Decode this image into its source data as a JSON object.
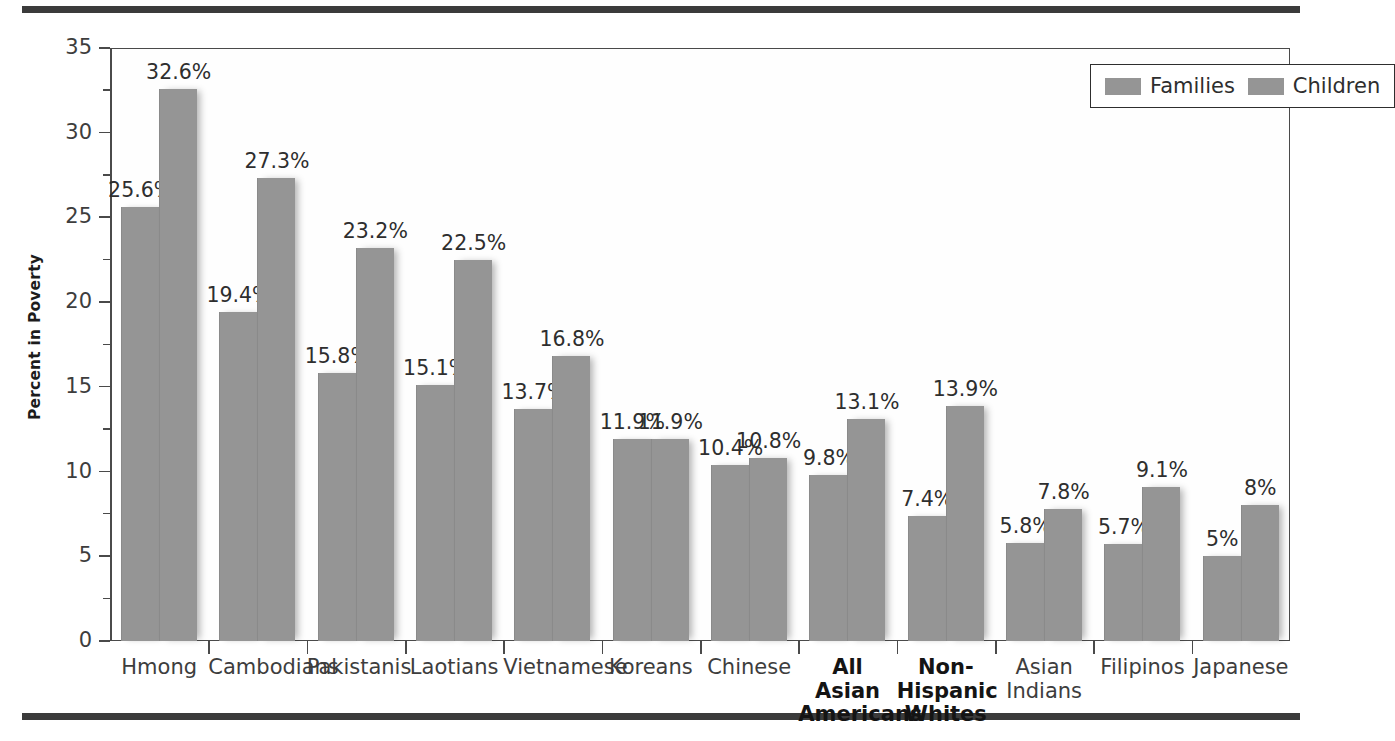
{
  "figure": {
    "y_axis_title": "Percent in Poverty",
    "rule_color": "#3b3b3b",
    "bar_color": "#959595"
  },
  "legend": {
    "position": "top-right",
    "entries": [
      {
        "label": "Families",
        "swatch": "#959595"
      },
      {
        "label": "Children",
        "swatch": "#959595"
      }
    ]
  },
  "y_axis": {
    "ticks": [
      "0",
      "5",
      "10",
      "15",
      "20",
      "25",
      "30",
      "35"
    ]
  },
  "chart_data": {
    "type": "bar",
    "title": "",
    "xlabel": "",
    "ylabel": "Percent in Poverty",
    "ylim": [
      0,
      35
    ],
    "ytick_step": 5,
    "grid": false,
    "legend_position": "top-right",
    "categories": [
      "Hmong",
      "Cambodians",
      "Pakistanis",
      "Laotians",
      "Vietnamese",
      "Koreans",
      "Chinese",
      "All\nAsian\nAmericans",
      "Non-\nHispanic\nWhites",
      "Asian\nIndians",
      "Filipinos",
      "Japanese"
    ],
    "categories_bold": [
      false,
      false,
      false,
      false,
      false,
      false,
      false,
      true,
      true,
      false,
      false,
      false
    ],
    "series": [
      {
        "name": "Families",
        "values": [
          25.6,
          19.4,
          15.8,
          15.1,
          13.7,
          11.9,
          10.4,
          9.8,
          7.4,
          5.8,
          5.7,
          5.0
        ],
        "labels": [
          "25.6%",
          "19.4%",
          "15.8%",
          "15.1%",
          "13.7%",
          "11.9%",
          "10.4%",
          "9.8%",
          "7.4%",
          "5.8%",
          "5.7%",
          "5%"
        ]
      },
      {
        "name": "Children",
        "values": [
          32.6,
          27.3,
          23.2,
          22.5,
          16.8,
          11.9,
          10.8,
          13.1,
          13.9,
          7.8,
          9.1,
          8.0
        ],
        "labels": [
          "32.6%",
          "27.3%",
          "23.2%",
          "22.5%",
          "16.8%",
          "11.9%",
          "10.8%",
          "13.1%",
          "13.9%",
          "7.8%",
          "9.1%",
          "8%"
        ]
      }
    ]
  }
}
